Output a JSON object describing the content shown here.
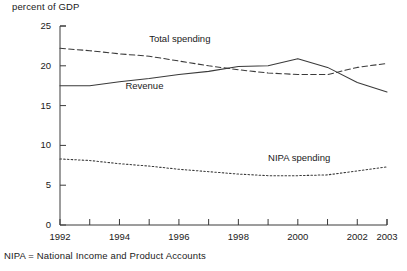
{
  "chart_data": {
    "type": "line",
    "title": "",
    "ylabel": "percent of GDP",
    "xlabel": "",
    "ylim": [
      0,
      25
    ],
    "xlim": [
      1992,
      2003
    ],
    "yticks": [
      0,
      5,
      10,
      15,
      20,
      25
    ],
    "ytick_labels": [
      "0",
      "5",
      "10",
      "15",
      "20",
      "25"
    ],
    "xticks": [
      1992,
      1993,
      1994,
      1995,
      1996,
      1997,
      1998,
      1999,
      2000,
      2001,
      2002,
      2003
    ],
    "xtick_labels": [
      "1992",
      "",
      "1994",
      "",
      "1996",
      "",
      "1998",
      "",
      "2000",
      "",
      "2002",
      "2003"
    ],
    "grid": false,
    "legend_position": "inline-annotations",
    "x": [
      1992,
      1993,
      1994,
      1995,
      1996,
      1997,
      1998,
      1999,
      2000,
      2001,
      2002,
      2003
    ],
    "series": [
      {
        "name": "Total spending",
        "style": "dashed",
        "color": "#3a3a3a",
        "label_x": 1995.0,
        "label_y": 23.0,
        "values": [
          22.2,
          21.9,
          21.5,
          21.2,
          20.6,
          20.0,
          19.5,
          19.1,
          18.9,
          18.9,
          19.8,
          20.3
        ]
      },
      {
        "name": "Revenue",
        "style": "solid",
        "color": "#3a3a3a",
        "label_x": 1994.2,
        "label_y": 17.1,
        "values": [
          17.5,
          17.5,
          18.0,
          18.4,
          18.9,
          19.3,
          19.9,
          20.0,
          20.9,
          19.8,
          17.9,
          16.7
        ]
      },
      {
        "name": "NIPA spending",
        "style": "dotted",
        "color": "#3a3a3a",
        "label_x": 1999.0,
        "label_y": 8.1,
        "values": [
          8.3,
          8.1,
          7.7,
          7.4,
          7.0,
          6.7,
          6.4,
          6.2,
          6.2,
          6.3,
          6.8,
          7.3
        ]
      }
    ],
    "footnote": "NIPA  =  National Income and Product Accounts"
  },
  "geometry": {
    "plot_left": 60,
    "plot_right": 387,
    "plot_top": 26,
    "plot_bottom": 225
  }
}
